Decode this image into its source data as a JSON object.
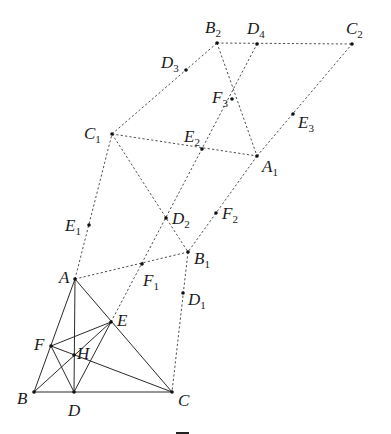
{
  "figure": {
    "points": [
      {
        "id": "A",
        "base": "A",
        "sub": ""
      },
      {
        "id": "B",
        "base": "B",
        "sub": ""
      },
      {
        "id": "C",
        "base": "C",
        "sub": ""
      },
      {
        "id": "D",
        "base": "D",
        "sub": ""
      },
      {
        "id": "E",
        "base": "E",
        "sub": ""
      },
      {
        "id": "F",
        "base": "F",
        "sub": ""
      },
      {
        "id": "H",
        "base": "H",
        "sub": ""
      },
      {
        "id": "A1",
        "base": "A",
        "sub": "1"
      },
      {
        "id": "B1",
        "base": "B",
        "sub": "1"
      },
      {
        "id": "C1",
        "base": "C",
        "sub": "1"
      },
      {
        "id": "D1",
        "base": "D",
        "sub": "1"
      },
      {
        "id": "E1",
        "base": "E",
        "sub": "1"
      },
      {
        "id": "F1",
        "base": "F",
        "sub": "1"
      },
      {
        "id": "B2",
        "base": "B",
        "sub": "2"
      },
      {
        "id": "C2",
        "base": "C",
        "sub": "2"
      },
      {
        "id": "D2",
        "base": "D",
        "sub": "2"
      },
      {
        "id": "E2",
        "base": "E",
        "sub": "2"
      },
      {
        "id": "F2",
        "base": "F",
        "sub": "2"
      },
      {
        "id": "D3",
        "base": "D",
        "sub": "3"
      },
      {
        "id": "E3",
        "base": "E",
        "sub": "3"
      },
      {
        "id": "F3",
        "base": "F",
        "sub": "3"
      },
      {
        "id": "D4",
        "base": "D",
        "sub": "4"
      }
    ],
    "solid_segments": [
      [
        "A",
        "B"
      ],
      [
        "B",
        "C"
      ],
      [
        "A",
        "C"
      ],
      [
        "A",
        "D"
      ],
      [
        "B",
        "E"
      ],
      [
        "C",
        "F"
      ],
      [
        "F",
        "E"
      ],
      [
        "F",
        "D"
      ],
      [
        "D",
        "E"
      ]
    ],
    "dashed_segments": [
      [
        "A",
        "C1"
      ],
      [
        "A",
        "B1"
      ],
      [
        "B1",
        "C"
      ],
      [
        "C1",
        "B1"
      ],
      [
        "C1",
        "A1"
      ],
      [
        "C1",
        "B2"
      ],
      [
        "B2",
        "C2"
      ],
      [
        "B2",
        "A1"
      ],
      [
        "A1",
        "C2"
      ],
      [
        "A1",
        "B1"
      ],
      [
        "E",
        "D4"
      ]
    ]
  }
}
